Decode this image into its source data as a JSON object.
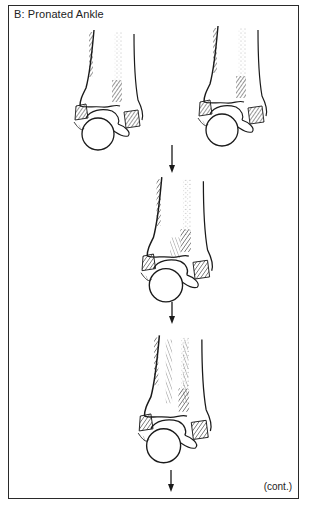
{
  "figure": {
    "title": "B:  Pronated Ankle",
    "continuation": "(cont.)",
    "border_color": "#2a2a2a",
    "line_color": "#1a1a1a",
    "panels": [
      {
        "id": "ankle-top-left",
        "label": "Pronated ankle, initial view (left)"
      },
      {
        "id": "ankle-top-right",
        "label": "Pronated ankle, initial view (right)"
      },
      {
        "id": "ankle-middle",
        "label": "Pronated ankle, progression stage 2"
      },
      {
        "id": "ankle-bottom",
        "label": "Pronated ankle, progression stage 3"
      }
    ],
    "arrows": [
      {
        "id": "arrow-1",
        "direction": "down"
      },
      {
        "id": "arrow-2",
        "direction": "down"
      },
      {
        "id": "arrow-3",
        "direction": "down"
      }
    ]
  }
}
